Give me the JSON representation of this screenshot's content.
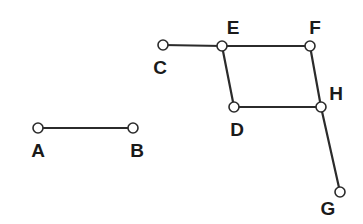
{
  "figure": {
    "title": "",
    "background_color": "#ffffff",
    "width": 363,
    "height": 224,
    "edge_color": "#2b2b2b",
    "node_fill_color": "#ffffff",
    "node_stroke_color": "#2b2b2b",
    "label_color": "#1a1a1a"
  },
  "chart_data": {
    "type": "diagram",
    "subtype": "node-link-graph",
    "title": "",
    "xlabel": "",
    "ylabel": "",
    "grid": false,
    "legend": null,
    "coordinate_space": {
      "width": 363,
      "height": 224,
      "origin": "top-left"
    },
    "node_radius": 5,
    "nodes": [
      {
        "id": "A",
        "label": "A",
        "x": 38,
        "y": 128,
        "label_x": 38,
        "label_y": 150,
        "label_position": "below"
      },
      {
        "id": "B",
        "label": "B",
        "x": 133,
        "y": 128,
        "label_x": 137,
        "label_y": 150,
        "label_position": "below"
      },
      {
        "id": "C",
        "label": "C",
        "x": 163,
        "y": 45,
        "label_x": 160,
        "label_y": 67,
        "label_position": "below"
      },
      {
        "id": "D",
        "label": "D",
        "x": 234,
        "y": 107,
        "label_x": 237,
        "label_y": 129,
        "label_position": "below"
      },
      {
        "id": "E",
        "label": "E",
        "x": 222,
        "y": 46,
        "label_x": 233,
        "label_y": 27,
        "label_position": "above-right"
      },
      {
        "id": "F",
        "label": "F",
        "x": 310,
        "y": 46,
        "label_x": 315,
        "label_y": 27,
        "label_position": "above-right"
      },
      {
        "id": "G",
        "label": "G",
        "x": 340,
        "y": 192,
        "label_x": 328,
        "label_y": 208,
        "label_position": "below-left"
      },
      {
        "id": "H",
        "label": "H",
        "x": 321,
        "y": 107,
        "label_x": 336,
        "label_y": 93,
        "label_position": "above-right"
      }
    ],
    "edges": [
      {
        "from": "A",
        "to": "B"
      },
      {
        "from": "C",
        "to": "E"
      },
      {
        "from": "E",
        "to": "F"
      },
      {
        "from": "E",
        "to": "D"
      },
      {
        "from": "D",
        "to": "H"
      },
      {
        "from": "F",
        "to": "H"
      },
      {
        "from": "H",
        "to": "G"
      }
    ],
    "components": [
      {
        "name": "segment-AB",
        "nodes": [
          "A",
          "B"
        ]
      },
      {
        "name": "graph-CDEFGH",
        "nodes": [
          "C",
          "D",
          "E",
          "F",
          "G",
          "H"
        ]
      }
    ]
  }
}
